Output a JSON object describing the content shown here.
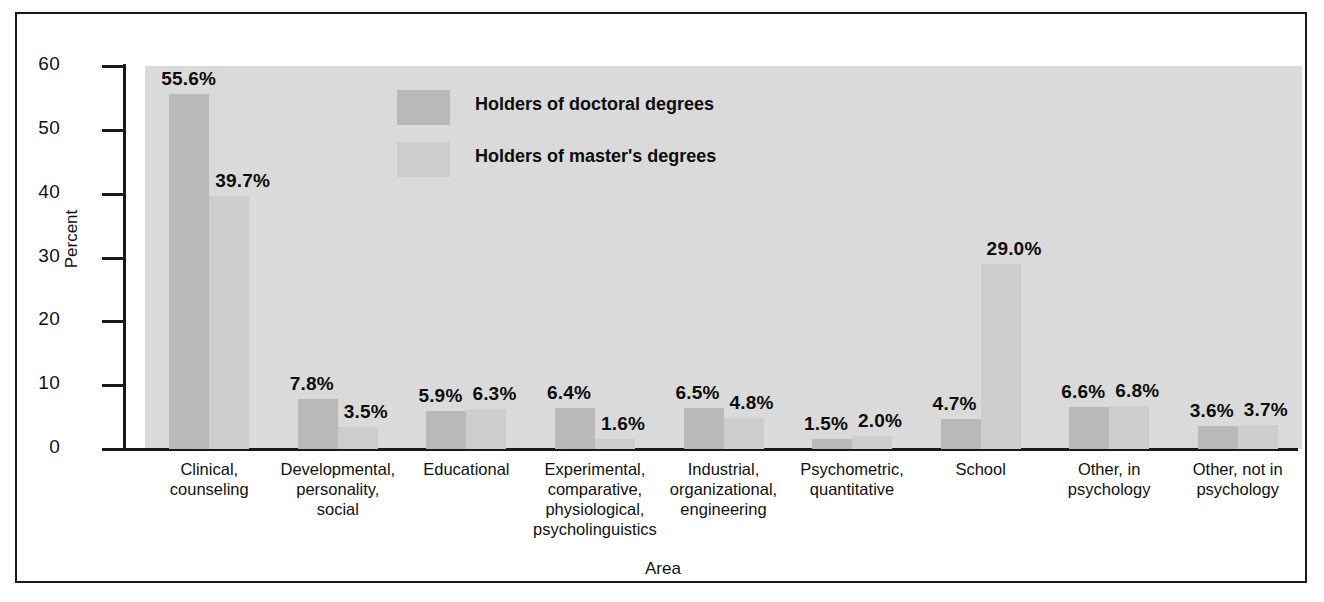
{
  "chart_data": {
    "type": "bar",
    "title": "",
    "xlabel": "Area",
    "ylabel": "Percent",
    "ylim": [
      0,
      60
    ],
    "yticks": [
      0,
      10,
      20,
      30,
      40,
      50,
      60
    ],
    "ytick_labels": [
      "0",
      "10",
      "20",
      "30",
      "40",
      "50",
      "60"
    ],
    "grid": false,
    "legend_position": "upper-center-left",
    "categories": [
      "Clinical,\ncounseling",
      "Developmental,\npersonality,\nsocial",
      "Educational",
      "Experimental,\ncomparative,\nphysiological,\npsycholinguistics",
      "Industrial,\norganizational,\nengineering",
      "Psychometric,\nquantitative",
      "School",
      "Other, in\npsychology",
      "Other, not in\npsychology"
    ],
    "series": [
      {
        "name": "Holders of doctoral degrees",
        "color": "#b9b9b9",
        "values": [
          55.6,
          7.8,
          5.9,
          6.4,
          6.5,
          1.5,
          4.7,
          6.6,
          3.6
        ],
        "labels": [
          "55.6%",
          "7.8%",
          "5.9%",
          "6.4%",
          "6.5%",
          "1.5%",
          "4.7%",
          "6.6%",
          "3.6%"
        ]
      },
      {
        "name": "Holders of master's degrees",
        "color": "#cdcdcd",
        "values": [
          39.7,
          3.5,
          6.3,
          1.6,
          4.8,
          2.0,
          29.0,
          6.8,
          3.7
        ],
        "labels": [
          "39.7%",
          "3.5%",
          "6.3%",
          "1.6%",
          "4.8%",
          "2.0%",
          "29.0%",
          "6.8%",
          "3.7%"
        ]
      }
    ]
  },
  "colors": {
    "plot_background": "#dadada",
    "doctoral_bar": "#b9b9b9",
    "masters_bar": "#cdcdcd",
    "axis": "#1a1a1a",
    "text": "#111111",
    "page_background": "#ffffff"
  }
}
